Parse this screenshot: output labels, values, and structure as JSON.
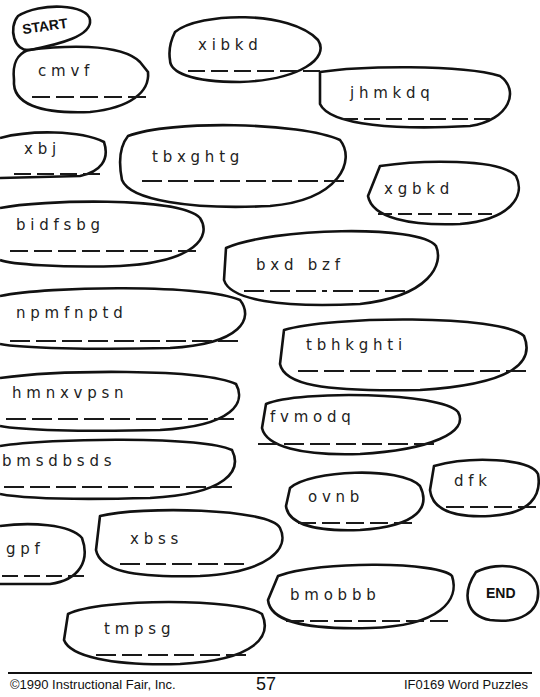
{
  "puzzle": {
    "start_label": "START",
    "end_label": "END",
    "bubbles": [
      {
        "letters": "c m v f",
        "blanks": 5
      },
      {
        "letters": "x i b k d",
        "blanks": 6
      },
      {
        "letters": "j h m k d q",
        "blanks": 7
      },
      {
        "letters": "x b j",
        "blanks": 4
      },
      {
        "letters": "t b x g h t g",
        "blanks": 8
      },
      {
        "letters": "x g b k d",
        "blanks": 6
      },
      {
        "letters": "b i d f s b g",
        "blanks": 8
      },
      {
        "letters": "b x d   b z f",
        "blanks": 7
      },
      {
        "letters": "n p m f n p t d",
        "blanks": 9
      },
      {
        "letters": "t b h k g h t i",
        "blanks": 9
      },
      {
        "letters": "h m n x v p s n",
        "blanks": 9
      },
      {
        "letters": "f v m o d q",
        "blanks": 7
      },
      {
        "letters": "b m s d b s d s",
        "blanks": 9
      },
      {
        "letters": "o v n b",
        "blanks": 5
      },
      {
        "letters": "d f k",
        "blanks": 4
      },
      {
        "letters": "g p f",
        "blanks": 4
      },
      {
        "letters": "x b s s",
        "blanks": 5
      },
      {
        "letters": "b m o b b b",
        "blanks": 7
      },
      {
        "letters": "t m p s g",
        "blanks": 6
      }
    ]
  },
  "footer": {
    "copyright": "©1990 Instructional Fair, Inc.",
    "page_number": "57",
    "book_title": "IF0169 Word Puzzles"
  }
}
